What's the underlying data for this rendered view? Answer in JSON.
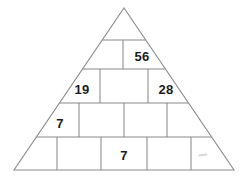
{
  "figure": {
    "type": "number-pyramid-puzzle",
    "background_color": "#ffffff",
    "line_color": "#8a8a8a",
    "text_color": "#1c1c1c",
    "smudge_color": "#d6d6d6",
    "apex": {
      "x": 124,
      "y": 8
    },
    "base_left": {
      "x": 14,
      "y": 170
    },
    "base_right": {
      "x": 234,
      "y": 170
    },
    "row_dividers_y": [
      40,
      69,
      103,
      137,
      170
    ]
  },
  "rows": [
    {
      "index": 1,
      "label": "row-1",
      "y_top": 8,
      "y_bottom": 40,
      "cells": [
        {
          "label": "r1c1",
          "value": "",
          "cx": 124,
          "cy": 28,
          "filled": false
        }
      ]
    },
    {
      "index": 2,
      "label": "row-2",
      "y_top": 40,
      "y_bottom": 69,
      "dividers_x": [
        123
      ],
      "cells": [
        {
          "label": "r2c1",
          "value": "",
          "cx": 105,
          "cy": 56,
          "filled": false
        },
        {
          "label": "r2c2",
          "value": "56",
          "cx": 142,
          "cy": 56,
          "filled": true
        }
      ]
    },
    {
      "index": 3,
      "label": "row-3",
      "y_top": 69,
      "y_bottom": 103,
      "dividers_x": [
        100,
        148
      ],
      "cells": [
        {
          "label": "r3c1",
          "value": "19",
          "cx": 82,
          "cy": 89,
          "filled": true
        },
        {
          "label": "r3c2",
          "value": "",
          "cx": 124,
          "cy": 89,
          "filled": false
        },
        {
          "label": "r3c3",
          "value": "28",
          "cx": 166,
          "cy": 89,
          "filled": true
        }
      ]
    },
    {
      "index": 4,
      "label": "row-4",
      "y_top": 103,
      "y_bottom": 137,
      "dividers_x": [
        79,
        124,
        167
      ],
      "cells": [
        {
          "label": "r4c1",
          "value": "7",
          "cx": 60,
          "cy": 123,
          "filled": true
        },
        {
          "label": "r4c2",
          "value": "",
          "cx": 101,
          "cy": 123,
          "filled": false
        },
        {
          "label": "r4c3",
          "value": "",
          "cx": 145,
          "cy": 123,
          "filled": false
        },
        {
          "label": "r4c4",
          "value": "",
          "cx": 190,
          "cy": 123,
          "filled": false
        }
      ]
    },
    {
      "index": 5,
      "label": "row-5",
      "y_top": 137,
      "y_bottom": 170,
      "dividers_x": [
        57,
        101,
        147,
        191
      ],
      "cells": [
        {
          "label": "r5c1",
          "value": "",
          "cx": 36,
          "cy": 155,
          "filled": false
        },
        {
          "label": "r5c2",
          "value": "",
          "cx": 79,
          "cy": 155,
          "filled": false
        },
        {
          "label": "r5c3",
          "value": "7",
          "cx": 124,
          "cy": 155,
          "filled": true
        },
        {
          "label": "r5c4",
          "value": "",
          "cx": 169,
          "cy": 155,
          "filled": false
        },
        {
          "label": "r5c5",
          "value": "",
          "cx": 206,
          "cy": 155,
          "filled": false,
          "smudge": true
        }
      ]
    }
  ],
  "values_present": [
    "56",
    "19",
    "28",
    "7",
    "7"
  ],
  "marks": [
    {
      "name": "faint-smudge",
      "cx": 203,
      "cy": 155,
      "color": "#d6d6d6"
    }
  ]
}
